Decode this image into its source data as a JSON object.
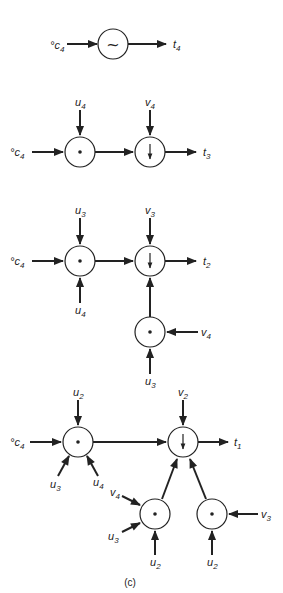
{
  "caption": "(c)",
  "colors": {
    "stroke": "#222222",
    "background": "#ffffff"
  },
  "diagrams": [
    {
      "id": "d1",
      "input": {
        "base": "c",
        "sub": "4",
        "prefix": "°"
      },
      "output": {
        "base": "t",
        "sub": "4"
      },
      "nodes": [
        {
          "id": "n1",
          "symbol": "~"
        }
      ]
    },
    {
      "id": "d2",
      "input": {
        "base": "c",
        "sub": "4",
        "prefix": "°"
      },
      "output": {
        "base": "t",
        "sub": "3"
      },
      "labels": {
        "a": {
          "base": "u",
          "sub": "4"
        },
        "b": {
          "base": "v",
          "sub": "4"
        }
      }
    },
    {
      "id": "d3",
      "input": {
        "base": "c",
        "sub": "4",
        "prefix": "°"
      },
      "output": {
        "base": "t",
        "sub": "2"
      },
      "labels": {
        "a": {
          "base": "u",
          "sub": "3"
        },
        "b": {
          "base": "v",
          "sub": "3"
        },
        "c": {
          "base": "u",
          "sub": "4"
        },
        "d": {
          "base": "v",
          "sub": "4"
        },
        "e": {
          "base": "u",
          "sub": "3"
        }
      }
    },
    {
      "id": "d4",
      "input": {
        "base": "c",
        "sub": "4",
        "prefix": "°"
      },
      "output": {
        "base": "t",
        "sub": "1"
      },
      "labels": {
        "a": {
          "base": "u",
          "sub": "2"
        },
        "b": {
          "base": "v",
          "sub": "2"
        },
        "c": {
          "base": "u",
          "sub": "3"
        },
        "d": {
          "base": "u",
          "sub": "4"
        },
        "e": {
          "base": "v",
          "sub": "4"
        },
        "f": {
          "base": "u",
          "sub": "3"
        },
        "g": {
          "base": "u",
          "sub": "2"
        },
        "h": {
          "base": "u",
          "sub": "2"
        },
        "i": {
          "base": "v",
          "sub": "3"
        }
      }
    }
  ]
}
